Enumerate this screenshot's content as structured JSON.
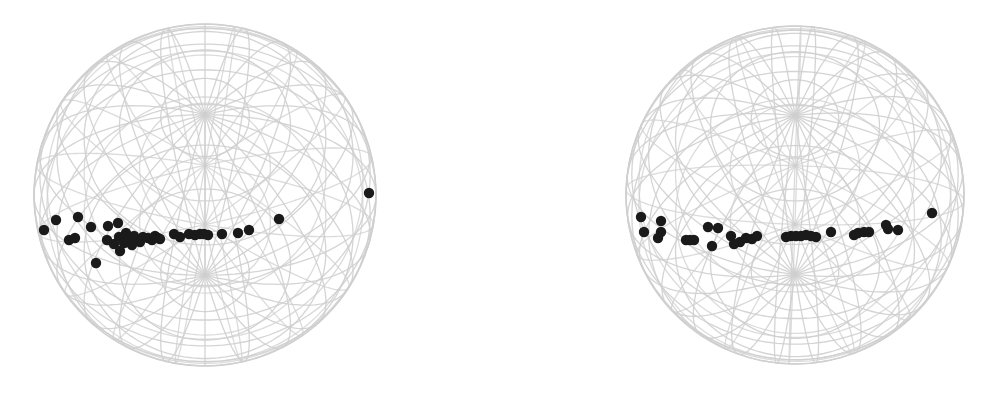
{
  "colors": {
    "background": "#ffffff",
    "wireframe": "#cfcfcf",
    "point": "#1a1a1a"
  },
  "chart_data": [
    {
      "type": "scatter",
      "title": "",
      "projection": "orthographic sphere (wireframe)",
      "sphere": {
        "cx": 205,
        "cy": 195,
        "r": 171
      },
      "grid": {
        "meridians": 24,
        "parallels": 12,
        "tilt_deg": 62,
        "rot_deg": 0
      },
      "points_px": [
        [
          44,
          230
        ],
        [
          56,
          220
        ],
        [
          78,
          217
        ],
        [
          69,
          240
        ],
        [
          75,
          238
        ],
        [
          91,
          227
        ],
        [
          96,
          263
        ],
        [
          108,
          226
        ],
        [
          107,
          240
        ],
        [
          118,
          223
        ],
        [
          114,
          244
        ],
        [
          120,
          251
        ],
        [
          119,
          237
        ],
        [
          124,
          243
        ],
        [
          126,
          233
        ],
        [
          130,
          240
        ],
        [
          134,
          236
        ],
        [
          140,
          242
        ],
        [
          132,
          245
        ],
        [
          143,
          237
        ],
        [
          148,
          238
        ],
        [
          152,
          240
        ],
        [
          155,
          236
        ],
        [
          158,
          238
        ],
        [
          160,
          239
        ],
        [
          174,
          234
        ],
        [
          180,
          237
        ],
        [
          189,
          234
        ],
        [
          195,
          235
        ],
        [
          200,
          234
        ],
        [
          204,
          234
        ],
        [
          208,
          235
        ],
        [
          222,
          234
        ],
        [
          238,
          233
        ],
        [
          249,
          230
        ],
        [
          279,
          219
        ],
        [
          369,
          193
        ]
      ]
    },
    {
      "type": "scatter",
      "title": "",
      "projection": "orthographic sphere (wireframe)",
      "sphere": {
        "cx": 795,
        "cy": 195,
        "r": 169
      },
      "grid": {
        "meridians": 24,
        "parallels": 12,
        "tilt_deg": 62,
        "rot_deg": 8
      },
      "points_px": [
        [
          641,
          217
        ],
        [
          644,
          232
        ],
        [
          661,
          221
        ],
        [
          658,
          238
        ],
        [
          661,
          232
        ],
        [
          686,
          240
        ],
        [
          690,
          240
        ],
        [
          694,
          240
        ],
        [
          708,
          227
        ],
        [
          712,
          246
        ],
        [
          718,
          228
        ],
        [
          731,
          236
        ],
        [
          734,
          244
        ],
        [
          740,
          242
        ],
        [
          746,
          238
        ],
        [
          752,
          239
        ],
        [
          757,
          236
        ],
        [
          786,
          237
        ],
        [
          791,
          236
        ],
        [
          796,
          236
        ],
        [
          801,
          236
        ],
        [
          806,
          235
        ],
        [
          811,
          236
        ],
        [
          816,
          237
        ],
        [
          831,
          232
        ],
        [
          854,
          235
        ],
        [
          858,
          233
        ],
        [
          864,
          232
        ],
        [
          869,
          232
        ],
        [
          886,
          225
        ],
        [
          888,
          229
        ],
        [
          898,
          230
        ],
        [
          932,
          213
        ]
      ]
    }
  ]
}
